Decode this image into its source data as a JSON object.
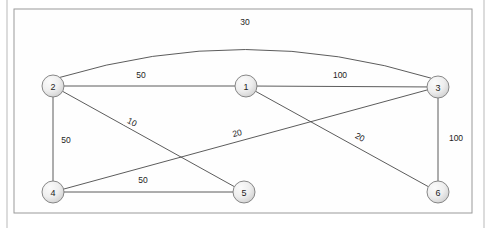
{
  "figure": {
    "node_radius": 11,
    "colors": {
      "edge": "#4a4a4a",
      "node_fill_light": "#f4f4f4",
      "node_fill_dark": "#d2d2d2",
      "node_stroke": "#7a7a7a",
      "frame_stroke": "#9a9a9a",
      "gutter_stroke": "#b9b9b9",
      "text": "#1d1d1d",
      "background": "#ffffff"
    },
    "frame": {
      "x": 14,
      "y": 9,
      "width": 458,
      "height": 204
    },
    "gutters": {
      "left_x": 7,
      "right_x": 484,
      "top_y": 0,
      "bottom_y": 228
    }
  },
  "nodes": [
    {
      "id": "1",
      "label": "1",
      "x": 246,
      "y": 86
    },
    {
      "id": "2",
      "label": "2",
      "x": 53,
      "y": 86
    },
    {
      "id": "3",
      "label": "3",
      "x": 438,
      "y": 87
    },
    {
      "id": "4",
      "label": "4",
      "x": 53,
      "y": 192
    },
    {
      "id": "5",
      "label": "5",
      "x": 244,
      "y": 192
    },
    {
      "id": "6",
      "label": "6",
      "x": 438,
      "y": 192
    }
  ],
  "edges": [
    {
      "id": "e-2-3",
      "from": "2",
      "to": "3",
      "weight": "30",
      "curved": true,
      "label_x": 245,
      "label_y": 22,
      "label_rotation": 0
    },
    {
      "id": "e-2-1",
      "from": "2",
      "to": "1",
      "weight": "50",
      "curved": false,
      "label_x": 141,
      "label_y": 75,
      "label_rotation": 0
    },
    {
      "id": "e-1-3",
      "from": "1",
      "to": "3",
      "weight": "100",
      "curved": false,
      "label_x": 340,
      "label_y": 75,
      "label_rotation": 0
    },
    {
      "id": "e-2-4",
      "from": "2",
      "to": "4",
      "weight": "50",
      "curved": false,
      "label_x": 66,
      "label_y": 140,
      "label_rotation": 0
    },
    {
      "id": "e-2-5",
      "from": "2",
      "to": "5",
      "weight": "10",
      "curved": false,
      "label_x": 132,
      "label_y": 122,
      "label_rotation": 27
    },
    {
      "id": "e-4-3",
      "from": "4",
      "to": "3",
      "weight": "20",
      "curved": false,
      "label_x": 237,
      "label_y": 133,
      "label_rotation": -14
    },
    {
      "id": "e-1-6",
      "from": "1",
      "to": "6",
      "weight": "20",
      "curved": false,
      "label_x": 360,
      "label_y": 137,
      "label_rotation": 28
    },
    {
      "id": "e-3-6",
      "from": "3",
      "to": "6",
      "weight": "100",
      "curved": false,
      "label_x": 456,
      "label_y": 138,
      "label_rotation": 0
    },
    {
      "id": "e-4-5",
      "from": "4",
      "to": "5",
      "weight": "50",
      "curved": false,
      "label_x": 143,
      "label_y": 180,
      "label_rotation": 0
    }
  ],
  "chart_data": {
    "type": "diagram",
    "node_ids": [
      "1",
      "2",
      "3",
      "4",
      "5",
      "6"
    ],
    "adjacency": [
      {
        "source": "2",
        "target": "3",
        "weight": 30
      },
      {
        "source": "2",
        "target": "1",
        "weight": 50
      },
      {
        "source": "1",
        "target": "3",
        "weight": 100
      },
      {
        "source": "2",
        "target": "4",
        "weight": 50
      },
      {
        "source": "2",
        "target": "5",
        "weight": 10
      },
      {
        "source": "4",
        "target": "3",
        "weight": 20
      },
      {
        "source": "1",
        "target": "6",
        "weight": 20
      },
      {
        "source": "3",
        "target": "6",
        "weight": 100
      },
      {
        "source": "4",
        "target": "5",
        "weight": 50
      }
    ]
  }
}
